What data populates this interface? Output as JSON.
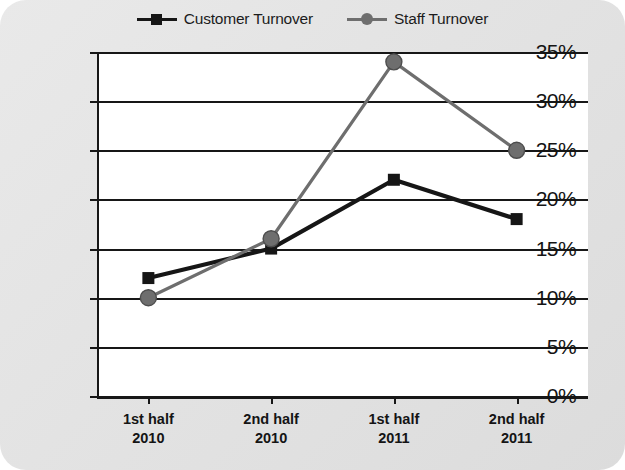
{
  "chart_data": {
    "type": "line",
    "title": "",
    "xlabel": "",
    "ylabel": "",
    "categories": [
      "1st half\n2010",
      "2nd half\n2010",
      "1st half\n2011",
      "2nd half\n2011"
    ],
    "category_lines": [
      {
        "line1": "1st half",
        "line2": "2010"
      },
      {
        "line1": "2nd half",
        "line2": "2010"
      },
      {
        "line1": "1st half",
        "line2": "2011"
      },
      {
        "line1": "2nd half",
        "line2": "2011"
      }
    ],
    "series": [
      {
        "name": "Customer Turnover",
        "values": [
          12,
          15,
          22,
          18
        ],
        "color": "#161616",
        "marker": "square"
      },
      {
        "name": "Staff Turnover",
        "values": [
          10,
          16,
          34,
          25
        ],
        "color": "#6e6e6e",
        "marker": "circle"
      }
    ],
    "ylim": [
      0,
      35
    ],
    "ytick_values": [
      0,
      5,
      10,
      15,
      20,
      25,
      30,
      35
    ],
    "ytick_labels": [
      "0%",
      "5%",
      "10%",
      "15%",
      "20%",
      "25%",
      "30%",
      "35%"
    ],
    "grid": true,
    "legend_position": "top-center"
  },
  "legend": {
    "items": [
      {
        "label": "Customer Turnover",
        "marker": "square-marker",
        "color": "#161616"
      },
      {
        "label": "Staff Turnover",
        "marker": "circle-marker",
        "color": "#6e6e6e"
      }
    ]
  },
  "colors": {
    "page_background": "#e5e5e5",
    "plot_background": "#ffffff",
    "axis": "#171717",
    "customer_series": "#161616",
    "staff_series": "#6e6e6e"
  }
}
